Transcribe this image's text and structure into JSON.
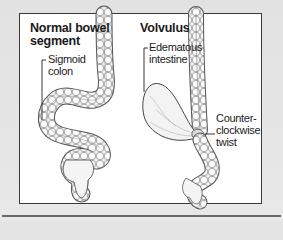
{
  "diagram": {
    "panels": [
      {
        "id": "normal",
        "heading_line1": "Normal bowel",
        "heading_line2": "segment",
        "labels": [
          {
            "id": "sigmoid",
            "line1": "Sigmoid",
            "line2": "colon"
          }
        ]
      },
      {
        "id": "volvulus",
        "heading_line1": "Volvulus",
        "labels": [
          {
            "id": "edematous",
            "line1": "Edematous",
            "line2": "intestine"
          },
          {
            "id": "twist",
            "line1": "Counter-",
            "line2": "clockwise",
            "line3": "twist"
          }
        ]
      }
    ],
    "colors": {
      "background": "#e4e4e4",
      "panel": "#ffffff",
      "border": "#3a3a3a",
      "bowel_fill": "#f2f2f2",
      "bowel_stroke": "#555555",
      "text": "#1a1a1a"
    }
  }
}
